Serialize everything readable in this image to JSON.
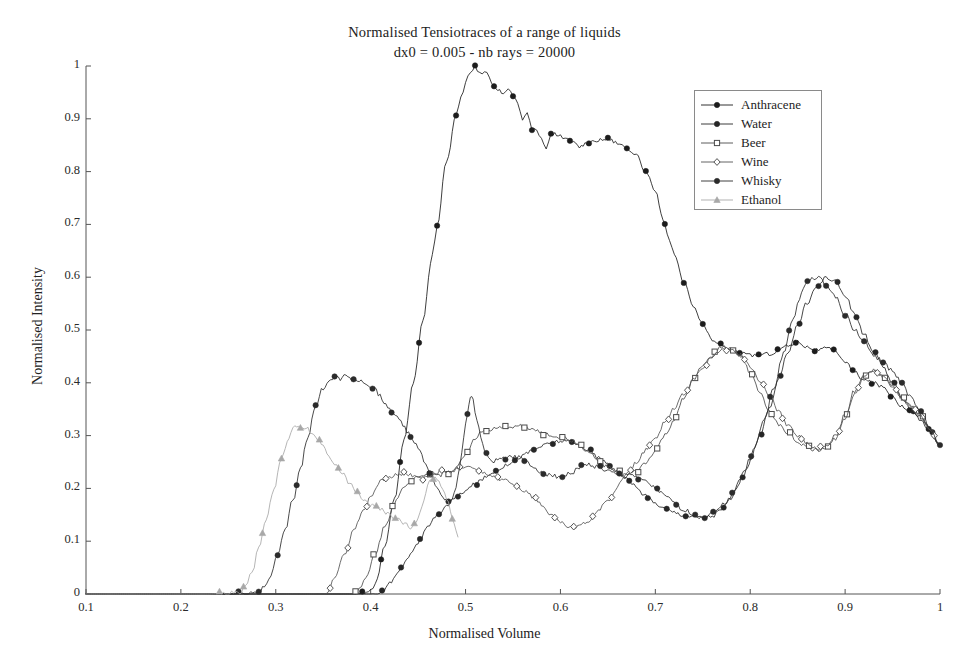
{
  "title": {
    "line1": "Normalised Tensiotraces of a range of liquids",
    "line2": "dx0 = 0.005 - nb rays = 20000"
  },
  "axes": {
    "xlabel": "Normalised Volume",
    "ylabel": "Normalised Intensity",
    "xticks": [
      "0.1",
      "0.2",
      "0.3",
      "0.4",
      "0.5",
      "0.6",
      "0.7",
      "0.8",
      "0.9",
      "1"
    ],
    "yticks": [
      "0",
      "0.1",
      "0.2",
      "0.3",
      "0.4",
      "0.5",
      "0.6",
      "0.7",
      "0.8",
      "0.9",
      "1"
    ],
    "xlim": [
      0.1,
      1.0
    ],
    "ylim": [
      0,
      1.0
    ]
  },
  "legend": {
    "position": "upper-right",
    "items": [
      {
        "label": "Anthracene",
        "marker": "filled-circle",
        "color": "#1c1c1c"
      },
      {
        "label": "Water",
        "marker": "filled-circle",
        "color": "#262626"
      },
      {
        "label": "Beer",
        "marker": "open-square",
        "color": "#4a4a4a"
      },
      {
        "label": "Wine",
        "marker": "open-diamond",
        "color": "#545454"
      },
      {
        "label": "Whisky",
        "marker": "filled-circle",
        "color": "#2b2b2b"
      },
      {
        "label": "Ethanol",
        "marker": "filled-triangle",
        "color": "#a8a8a8"
      }
    ]
  },
  "chart_data": {
    "type": "line",
    "title": "Normalised Tensiotraces of a range of liquids",
    "subtitle": "dx0 = 0.005 - nb rays = 20000",
    "xlabel": "Normalised Volume",
    "ylabel": "Normalised Intensity",
    "xlim": [
      0.1,
      1.0
    ],
    "ylim": [
      0,
      1.0
    ],
    "grid": false,
    "legend_position": "upper-right",
    "series": [
      {
        "name": "Anthracene",
        "marker": "filled-circle",
        "color": "#1c1c1c",
        "x": [
          0.1,
          0.2,
          0.3,
          0.38,
          0.4,
          0.405,
          0.415,
          0.425,
          0.435,
          0.445,
          0.455,
          0.465,
          0.47,
          0.48,
          0.49,
          0.495,
          0.5,
          0.505,
          0.51,
          0.515,
          0.52,
          0.525,
          0.53,
          0.54,
          0.545,
          0.55,
          0.555,
          0.56,
          0.565,
          0.57,
          0.575,
          0.58,
          0.585,
          0.59,
          0.6,
          0.605,
          0.61,
          0.62,
          0.63,
          0.64,
          0.65,
          0.66,
          0.665,
          0.67,
          0.675,
          0.68,
          0.69,
          0.7,
          0.71,
          0.715,
          0.72,
          0.73,
          0.74,
          0.75,
          0.76,
          0.78,
          0.8,
          0.82,
          0.84,
          0.85,
          0.86,
          0.87,
          0.88,
          0.89,
          0.9,
          0.91,
          0.92,
          0.93,
          0.94,
          0.95,
          0.96,
          0.97,
          0.98,
          0.99,
          1.0
        ],
        "y": [
          0.0,
          0.0,
          0.0,
          0.0,
          0.005,
          0.02,
          0.09,
          0.18,
          0.29,
          0.4,
          0.52,
          0.64,
          0.7,
          0.82,
          0.905,
          0.94,
          0.968,
          0.988,
          0.998,
          0.985,
          0.992,
          0.978,
          0.96,
          0.95,
          0.955,
          0.945,
          0.93,
          0.9,
          0.912,
          0.88,
          0.878,
          0.86,
          0.845,
          0.872,
          0.868,
          0.862,
          0.858,
          0.848,
          0.855,
          0.86,
          0.862,
          0.855,
          0.85,
          0.845,
          0.838,
          0.83,
          0.8,
          0.76,
          0.7,
          0.67,
          0.64,
          0.59,
          0.545,
          0.51,
          0.48,
          0.462,
          0.452,
          0.455,
          0.47,
          0.478,
          0.468,
          0.462,
          0.465,
          0.46,
          0.44,
          0.42,
          0.405,
          0.4,
          0.392,
          0.375,
          0.355,
          0.348,
          0.335,
          0.31,
          0.28
        ]
      },
      {
        "name": "Water",
        "marker": "filled-circle",
        "color": "#262626",
        "x": [
          0.1,
          0.3,
          0.4,
          0.412,
          0.42,
          0.43,
          0.44,
          0.45,
          0.46,
          0.47,
          0.48,
          0.49,
          0.5,
          0.51,
          0.52,
          0.53,
          0.54,
          0.55,
          0.56,
          0.57,
          0.58,
          0.59,
          0.6,
          0.61,
          0.62,
          0.63,
          0.64,
          0.65,
          0.66,
          0.665,
          0.67,
          0.675,
          0.68,
          0.69,
          0.7,
          0.71,
          0.72,
          0.73,
          0.74,
          0.75,
          0.76,
          0.77,
          0.78,
          0.79,
          0.8,
          0.81,
          0.82,
          0.83,
          0.84,
          0.85,
          0.86,
          0.87,
          0.88,
          0.89,
          0.9,
          0.91,
          0.92,
          0.93,
          0.94,
          0.95,
          0.96,
          0.97,
          0.98,
          0.99,
          1.0
        ],
        "y": [
          0.0,
          0.0,
          0.0,
          0.004,
          0.02,
          0.045,
          0.072,
          0.098,
          0.125,
          0.148,
          0.168,
          0.183,
          0.196,
          0.208,
          0.22,
          0.232,
          0.242,
          0.252,
          0.262,
          0.272,
          0.28,
          0.286,
          0.29,
          0.288,
          0.282,
          0.272,
          0.258,
          0.245,
          0.232,
          0.225,
          0.218,
          0.21,
          0.2,
          0.185,
          0.172,
          0.162,
          0.155,
          0.15,
          0.147,
          0.145,
          0.148,
          0.16,
          0.182,
          0.215,
          0.255,
          0.3,
          0.35,
          0.405,
          0.46,
          0.51,
          0.552,
          0.582,
          0.6,
          0.592,
          0.565,
          0.53,
          0.492,
          0.458,
          0.43,
          0.4,
          0.372,
          0.348,
          0.33,
          0.305,
          0.282
        ]
      },
      {
        "name": "Beer",
        "marker": "open-square",
        "color": "#4a4a4a",
        "x": [
          0.1,
          0.3,
          0.38,
          0.388,
          0.395,
          0.405,
          0.415,
          0.425,
          0.435,
          0.445,
          0.45,
          0.458,
          0.465,
          0.472,
          0.48,
          0.49,
          0.5,
          0.51,
          0.515,
          0.52,
          0.53,
          0.54,
          0.55,
          0.56,
          0.57,
          0.58,
          0.59,
          0.6,
          0.61,
          0.62,
          0.63,
          0.64,
          0.65,
          0.66,
          0.665,
          0.67,
          0.68,
          0.69,
          0.7,
          0.71,
          0.72,
          0.73,
          0.74,
          0.75,
          0.76,
          0.765,
          0.77,
          0.78,
          0.79,
          0.8,
          0.81,
          0.82,
          0.825,
          0.83,
          0.84,
          0.85,
          0.86,
          0.87,
          0.88,
          0.89,
          0.9,
          0.91,
          0.92,
          0.93,
          0.94,
          0.95,
          0.96,
          0.97,
          0.98,
          0.99,
          1.0
        ],
        "y": [
          0.0,
          0.0,
          0.0,
          0.008,
          0.03,
          0.078,
          0.128,
          0.172,
          0.2,
          0.218,
          0.225,
          0.228,
          0.228,
          0.225,
          0.23,
          0.238,
          0.265,
          0.295,
          0.305,
          0.308,
          0.312,
          0.315,
          0.318,
          0.318,
          0.312,
          0.305,
          0.3,
          0.298,
          0.292,
          0.282,
          0.268,
          0.252,
          0.24,
          0.232,
          0.228,
          0.225,
          0.232,
          0.248,
          0.272,
          0.3,
          0.33,
          0.37,
          0.405,
          0.432,
          0.45,
          0.462,
          0.468,
          0.465,
          0.45,
          0.42,
          0.385,
          0.345,
          0.33,
          0.322,
          0.305,
          0.288,
          0.278,
          0.272,
          0.278,
          0.3,
          0.34,
          0.385,
          0.415,
          0.425,
          0.41,
          0.395,
          0.372,
          0.355,
          0.338,
          0.312,
          0.282
        ]
      },
      {
        "name": "Wine",
        "marker": "open-diamond",
        "color": "#545454",
        "x": [
          0.1,
          0.3,
          0.35,
          0.355,
          0.362,
          0.372,
          0.382,
          0.392,
          0.402,
          0.412,
          0.42,
          0.428,
          0.435,
          0.442,
          0.45,
          0.455,
          0.46,
          0.468,
          0.475,
          0.482,
          0.49,
          0.498,
          0.505,
          0.512,
          0.52,
          0.53,
          0.54,
          0.55,
          0.56,
          0.57,
          0.58,
          0.59,
          0.6,
          0.61,
          0.62,
          0.63,
          0.64,
          0.65,
          0.66,
          0.665,
          0.67,
          0.68,
          0.69,
          0.7,
          0.71,
          0.72,
          0.73,
          0.74,
          0.75,
          0.76,
          0.77,
          0.775,
          0.78,
          0.79,
          0.8,
          0.81,
          0.82,
          0.83,
          0.84,
          0.85,
          0.86,
          0.87,
          0.88,
          0.89,
          0.9,
          0.91,
          0.92,
          0.93,
          0.94,
          0.95,
          0.96,
          0.97,
          0.98,
          0.99,
          1.0
        ],
        "y": [
          0.0,
          0.0,
          0.0,
          0.006,
          0.028,
          0.075,
          0.12,
          0.158,
          0.19,
          0.215,
          0.222,
          0.228,
          0.228,
          0.225,
          0.222,
          0.218,
          0.222,
          0.228,
          0.232,
          0.23,
          0.235,
          0.24,
          0.238,
          0.232,
          0.228,
          0.222,
          0.215,
          0.208,
          0.198,
          0.185,
          0.17,
          0.152,
          0.138,
          0.125,
          0.128,
          0.14,
          0.158,
          0.178,
          0.2,
          0.215,
          0.228,
          0.248,
          0.272,
          0.295,
          0.325,
          0.352,
          0.38,
          0.405,
          0.43,
          0.45,
          0.462,
          0.465,
          0.462,
          0.452,
          0.432,
          0.405,
          0.375,
          0.345,
          0.32,
          0.3,
          0.285,
          0.275,
          0.278,
          0.295,
          0.332,
          0.378,
          0.412,
          0.425,
          0.412,
          0.392,
          0.37,
          0.352,
          0.336,
          0.31,
          0.28
        ]
      },
      {
        "name": "Whisky",
        "marker": "filled-circle",
        "color": "#2b2b2b",
        "x": [
          0.1,
          0.25,
          0.28,
          0.288,
          0.295,
          0.302,
          0.31,
          0.318,
          0.326,
          0.334,
          0.342,
          0.35,
          0.356,
          0.362,
          0.368,
          0.374,
          0.38,
          0.386,
          0.392,
          0.398,
          0.404,
          0.41,
          0.416,
          0.422,
          0.428,
          0.434,
          0.44,
          0.446,
          0.452,
          0.458,
          0.462,
          0.466,
          0.47,
          0.474,
          0.478,
          0.482,
          0.486,
          0.49,
          0.494,
          0.498,
          0.502,
          0.505,
          0.508,
          0.512,
          0.516,
          0.52,
          0.526,
          0.532,
          0.54,
          0.548,
          0.556,
          0.564,
          0.572,
          0.58,
          0.59,
          0.6,
          0.61,
          0.62,
          0.63,
          0.64,
          0.65,
          0.66,
          0.668,
          0.672,
          0.68,
          0.69,
          0.7,
          0.71,
          0.72,
          0.73,
          0.74,
          0.748,
          0.755,
          0.765,
          0.775,
          0.785,
          0.795,
          0.805,
          0.815,
          0.825,
          0.835,
          0.845,
          0.852,
          0.858,
          0.865,
          0.872,
          0.88,
          0.89,
          0.9,
          0.91,
          0.92,
          0.93,
          0.94,
          0.95,
          0.96,
          0.97,
          0.98,
          0.99,
          1.0
        ],
        "y": [
          0.0,
          0.0,
          0.002,
          0.012,
          0.038,
          0.075,
          0.12,
          0.178,
          0.238,
          0.3,
          0.355,
          0.39,
          0.405,
          0.412,
          0.408,
          0.415,
          0.408,
          0.405,
          0.4,
          0.395,
          0.388,
          0.375,
          0.36,
          0.345,
          0.335,
          0.322,
          0.305,
          0.288,
          0.268,
          0.248,
          0.232,
          0.218,
          0.2,
          0.188,
          0.18,
          0.175,
          0.182,
          0.205,
          0.245,
          0.295,
          0.345,
          0.375,
          0.365,
          0.33,
          0.295,
          0.27,
          0.255,
          0.252,
          0.258,
          0.262,
          0.258,
          0.25,
          0.24,
          0.232,
          0.225,
          0.222,
          0.228,
          0.24,
          0.245,
          0.24,
          0.232,
          0.225,
          0.222,
          0.228,
          0.222,
          0.212,
          0.2,
          0.185,
          0.172,
          0.16,
          0.15,
          0.146,
          0.148,
          0.158,
          0.175,
          0.2,
          0.235,
          0.28,
          0.33,
          0.39,
          0.455,
          0.52,
          0.562,
          0.585,
          0.598,
          0.6,
          0.588,
          0.562,
          0.53,
          0.5,
          0.478,
          0.452,
          0.44,
          0.422,
          0.398,
          0.37,
          0.342,
          0.312,
          0.282
        ]
      },
      {
        "name": "Ethanol",
        "marker": "filled-triangle",
        "color": "#a8a8a8",
        "x": [
          0.1,
          0.23,
          0.262,
          0.268,
          0.275,
          0.282,
          0.29,
          0.298,
          0.306,
          0.314,
          0.32,
          0.326,
          0.332,
          0.338,
          0.344,
          0.35,
          0.356,
          0.362,
          0.37,
          0.378,
          0.386,
          0.394,
          0.402,
          0.41,
          0.418,
          0.424,
          0.43,
          0.436,
          0.442,
          0.448,
          0.452,
          0.456,
          0.46,
          0.464,
          0.468,
          0.472,
          0.476,
          0.48,
          0.484,
          0.488,
          0.492
        ],
        "y": [
          0.0,
          0.0,
          0.003,
          0.015,
          0.042,
          0.085,
          0.14,
          0.2,
          0.255,
          0.298,
          0.318,
          0.312,
          0.315,
          0.305,
          0.292,
          0.278,
          0.262,
          0.248,
          0.228,
          0.208,
          0.192,
          0.178,
          0.168,
          0.16,
          0.152,
          0.145,
          0.14,
          0.132,
          0.125,
          0.135,
          0.155,
          0.18,
          0.205,
          0.218,
          0.222,
          0.215,
          0.2,
          0.182,
          0.16,
          0.132,
          0.108
        ]
      }
    ]
  }
}
